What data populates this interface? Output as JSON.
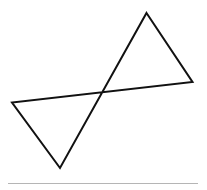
{
  "figure": {
    "shape": "bowtie-quadrilateral",
    "vertices": [
      "top",
      "right",
      "left",
      "bottom"
    ],
    "stroke_color": "#111111",
    "fill": "none",
    "baseline_color": "#b5b5b5"
  }
}
